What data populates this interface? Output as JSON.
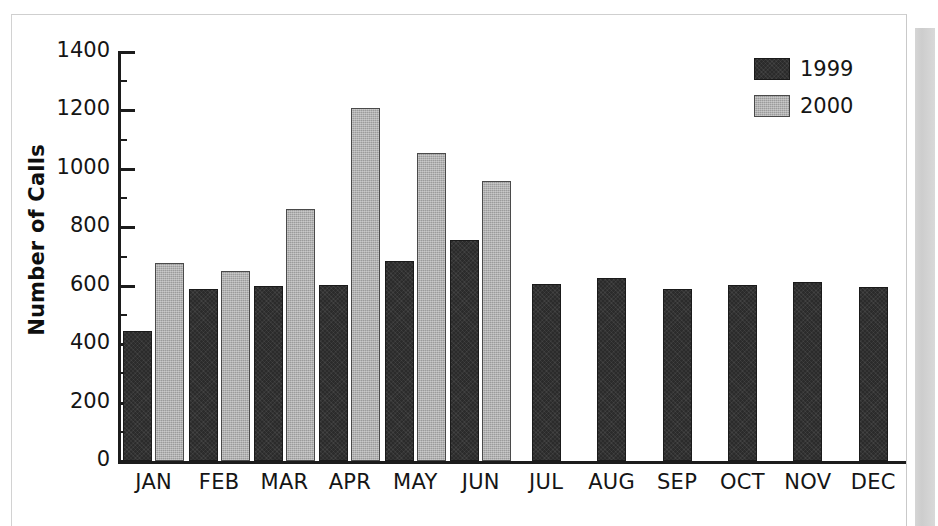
{
  "chart_data": {
    "type": "bar",
    "title": "",
    "xlabel": "",
    "ylabel": "Number of Calls",
    "categories": [
      "JAN",
      "FEB",
      "MAR",
      "APR",
      "MAY",
      "JUN",
      "JUL",
      "AUG",
      "SEP",
      "OCT",
      "NOV",
      "DEC"
    ],
    "series": [
      {
        "name": "1999",
        "color": "#2b2b2b",
        "values": [
          445,
          590,
          600,
          603,
          683,
          758,
          607,
          628,
          590,
          602,
          613,
          594
        ]
      },
      {
        "name": "2000",
        "color": "#9b9b9b",
        "values": [
          677,
          650,
          862,
          1207,
          1055,
          958,
          null,
          null,
          null,
          null,
          null,
          null
        ]
      }
    ],
    "ylim": [
      0,
      1400
    ],
    "ytick_labels": [
      "0",
      "200",
      "400",
      "600",
      "800",
      "1000",
      "1200",
      "1400"
    ],
    "ytick_values": [
      0,
      200,
      400,
      600,
      800,
      1000,
      1200,
      1400
    ],
    "yminor_values": [
      100,
      300,
      500,
      700,
      900,
      1100,
      1300
    ],
    "grid": false,
    "legend_position": "top-right"
  },
  "legend": {
    "entries": [
      {
        "label": "1999",
        "color": "#2b2b2b"
      },
      {
        "label": "2000",
        "color": "#9b9b9b"
      }
    ]
  },
  "axis": {
    "y_title": "Number of Calls"
  }
}
